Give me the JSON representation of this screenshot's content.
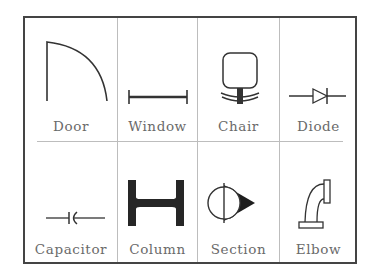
{
  "colors": {
    "frame": "#444444",
    "divider": "#bdbdbd",
    "stroke": "#333333",
    "label": "#6a6a6a"
  },
  "grid": {
    "rows": 2,
    "columns": 4
  },
  "symbols": [
    {
      "label": "Door",
      "icon": "door-icon"
    },
    {
      "label": "Window",
      "icon": "window-icon"
    },
    {
      "label": "Chair",
      "icon": "chair-icon"
    },
    {
      "label": "Diode",
      "icon": "diode-icon"
    },
    {
      "label": "Capacitor",
      "icon": "capacitor-icon"
    },
    {
      "label": "Column",
      "icon": "column-icon"
    },
    {
      "label": "Section",
      "icon": "section-icon"
    },
    {
      "label": "Elbow",
      "icon": "elbow-icon"
    }
  ]
}
